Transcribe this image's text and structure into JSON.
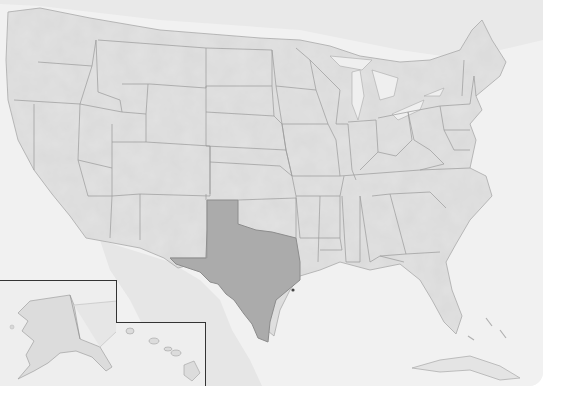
{
  "map": {
    "type": "choropleth-highlight",
    "subject": "United States (lower 48 with Alaska and Hawaii insets)",
    "highlighted_state": "Texas",
    "labels": [],
    "colors": {
      "ocean": "#f1f1f1",
      "land": "#e2e2e2",
      "state_border": "#9a9a9a",
      "highlight_fill": "#ababab",
      "highlight_border": "#8c8c8c",
      "inset_border": "#333333",
      "page_background": "#ffffff"
    },
    "insets": [
      {
        "name": "Alaska",
        "frame": "bottom-left"
      },
      {
        "name": "Hawaii",
        "frame": "bottom-left, right of Alaska"
      }
    ]
  }
}
